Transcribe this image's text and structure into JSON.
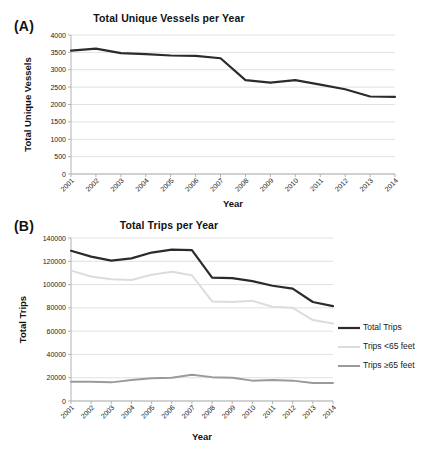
{
  "figure": {
    "panel_a_letter": "(A)",
    "panel_b_letter": "(B)"
  },
  "chart_data": [
    {
      "type": "line",
      "panel": "(A)",
      "title": "Total Unique Vessels per Year",
      "xlabel": "Year",
      "ylabel": "Total Unique Vessels",
      "categories": [
        "2001",
        "2002",
        "2003",
        "2004",
        "2005",
        "2006",
        "2007",
        "2008",
        "2009",
        "2010",
        "2011",
        "2012",
        "2013",
        "2014"
      ],
      "ylim": [
        0,
        4000
      ],
      "yticks": [
        0,
        500,
        1000,
        1500,
        2000,
        2500,
        3000,
        3500,
        4000
      ],
      "ytick_labels": [
        "0",
        "500",
        "1000",
        "1500",
        "2000",
        "2500",
        "3000",
        "3500",
        "4000"
      ],
      "grid": true,
      "legend": "none",
      "series": [
        {
          "name": "Total Unique Vessels",
          "color": "#2b2b2b",
          "width": 2.2,
          "values": [
            3550,
            3610,
            3480,
            3450,
            3410,
            3400,
            3330,
            2700,
            2630,
            2700,
            2570,
            2440,
            2230,
            2220
          ]
        }
      ]
    },
    {
      "type": "line",
      "panel": "(B)",
      "title": "Total Trips per Year",
      "xlabel": "Year",
      "ylabel": "Total Trips",
      "categories": [
        "2001",
        "2002",
        "2003",
        "2004",
        "2005",
        "2006",
        "2007",
        "2008",
        "2009",
        "2010",
        "2011",
        "2012",
        "2013",
        "2014"
      ],
      "ylim": [
        0,
        140000
      ],
      "yticks": [
        0,
        20000,
        40000,
        60000,
        80000,
        100000,
        120000,
        140000
      ],
      "ytick_labels": [
        "0",
        "20000",
        "40000",
        "60000",
        "80000",
        "100000",
        "120000",
        "140000"
      ],
      "grid": true,
      "legend": "right",
      "series": [
        {
          "name": "Total Trips",
          "color": "#2b2b2b",
          "width": 2.2,
          "values": [
            129000,
            124000,
            120500,
            122500,
            127500,
            130000,
            129500,
            106000,
            105500,
            103000,
            99000,
            96500,
            85000,
            81500
          ]
        },
        {
          "name": "Trips <65 feet",
          "color": "#dcdcdc",
          "width": 2.0,
          "values": [
            112000,
            107000,
            104500,
            104000,
            108500,
            111000,
            108000,
            85500,
            85000,
            86000,
            81000,
            80000,
            69500,
            66500
          ]
        },
        {
          "name": "Trips ≥65 feet",
          "color": "#9a9a9a",
          "width": 2.0,
          "values": [
            16500,
            16500,
            16000,
            18000,
            19500,
            20000,
            22500,
            20500,
            20000,
            17500,
            18000,
            17500,
            15500,
            15500
          ]
        }
      ]
    }
  ]
}
